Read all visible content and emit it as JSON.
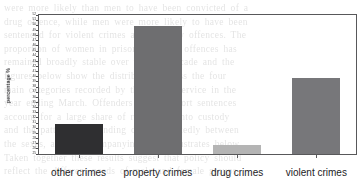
{
  "chart_data": {
    "type": "bar",
    "title": "",
    "xlabel": "",
    "ylabel": "percentage %",
    "categories": [
      "other crimes",
      "property crimes",
      "drug crimes",
      "violent crimes"
    ],
    "values": [
      31,
      50,
      27,
      40
    ],
    "ylim": [
      25,
      52
    ],
    "yticks": [
      25,
      26,
      27,
      28,
      29,
      30,
      31,
      32,
      33,
      34,
      35,
      36,
      37,
      38,
      39,
      40,
      41,
      42,
      43,
      44,
      45,
      46,
      47,
      48,
      49,
      50,
      51,
      52
    ],
    "grid": false,
    "legend": "none",
    "bar_colors": [
      "#2f2f31",
      "#6e6e70",
      "#b4b4b4",
      "#77777a"
    ]
  },
  "axis": {
    "y_title": "percentage %"
  },
  "ghost_text": {
    "lines": [
      "were  more  likely  than  men  to  have  been  convicted  of  a",
      "drug  offence,  while  men  were  more  likely  to  have  been",
      "sentenced  for  violent  crimes  and  property  offences.  The",
      "proportion  of  women  in  prison  for  other  offences  has",
      "remained  broadly  stable  over  the  last  decade  and  the",
      "figures  below  show  the  distribution  across  the  four",
      "main  categories  recorded  by  the  prison  service  in  the",
      "year  ending  March.  Offenders  serving  short  sentences",
      "account  for  a  large  share  of  receptions  into  custody",
      "and  the  pattern  of  offending  differs  markedly  between",
      "the  sexes,  as  the  accompanying  chart  illustrates  below.",
      "Taken  together  these  results  suggest  that  policy  should",
      "reflect  the  different  needs  of  male  and  female  groups."
    ]
  }
}
